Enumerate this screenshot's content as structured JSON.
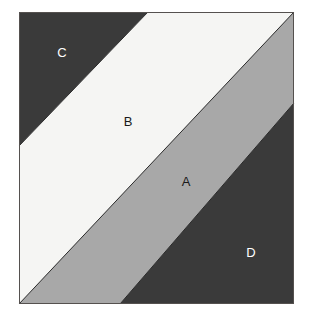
{
  "figure": {
    "title": "",
    "canvas": {
      "width": 312,
      "height": 319,
      "background": "#ffffff"
    },
    "frame": {
      "x": 19,
      "y": 12,
      "width": 275,
      "height": 292,
      "border_color": "#55514f",
      "border_width": 1
    },
    "colors": {
      "dark_gray": "#3a3a3a",
      "near_white": "#f5f5f3",
      "medium_gray": "#a8a8a8",
      "line": "#2b2b2b",
      "label_light": "#ffffff",
      "label_dark": "#1a1a1a"
    },
    "regions": [
      {
        "id": "C",
        "label": "C",
        "fill": "#3a3a3a",
        "label_color": "#ffffff",
        "label_x": 62,
        "label_y": 57,
        "shape": "top-left-triangle",
        "points": "19,12 148,12 19,146"
      },
      {
        "id": "B",
        "label": "B",
        "fill": "#f5f5f3",
        "label_color": "#1a1a1a",
        "label_x": 128,
        "label_y": 126,
        "shape": "diagonal-band",
        "points": "148,12 294,12 19,304 19,146"
      },
      {
        "id": "A",
        "label": "A",
        "fill": "#a8a8a8",
        "label_color": "#1a1a1a",
        "label_x": 186,
        "label_y": 186,
        "shape": "diagonal-band",
        "points": "294,12 294,103 120,304 19,304"
      },
      {
        "id": "D",
        "label": "D",
        "fill": "#3a3a3a",
        "label_color": "#ffffff",
        "label_x": 251,
        "label_y": 257,
        "shape": "bottom-right-triangle",
        "points": "294,103 294,304 120,304"
      }
    ],
    "boundaries": [
      {
        "id": "C-B",
        "x1": 148,
        "y1": 12,
        "x2": 19,
        "y2": 146
      },
      {
        "id": "B-A",
        "x1": 294,
        "y1": 12,
        "x2": 19,
        "y2": 304
      },
      {
        "id": "A-D",
        "x1": 294,
        "y1": 103,
        "x2": 120,
        "y2": 304
      }
    ]
  }
}
